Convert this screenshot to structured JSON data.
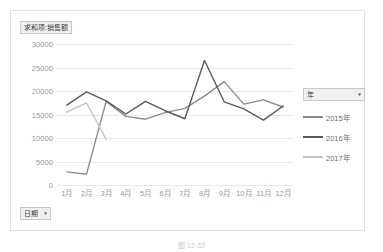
{
  "value_field": {
    "label": "求和项:销售额",
    "arrow": "▾"
  },
  "date_field": {
    "label": "日期",
    "arrow": "▾"
  },
  "legend_field": {
    "label": "年",
    "arrow": "▾"
  },
  "caption": "图 12-32",
  "colors": {
    "series_2015": "#8c8c8c",
    "series_2016": "#5a5a5a",
    "series_2017": "#c4c4c4",
    "gridline": "#e8e8e8",
    "axis_text": "#9a9a9a",
    "frame_border": "#e2e2e2",
    "field_button_bg": "#f0f0f0"
  },
  "chart_data": {
    "type": "line",
    "title": "求和项:销售额",
    "xlabel": "日期",
    "ylabel": "",
    "categories": [
      "1月",
      "2月",
      "3月",
      "4月",
      "5月",
      "6月",
      "7月",
      "8月",
      "9月",
      "10月",
      "11月",
      "12月"
    ],
    "ylim": [
      0,
      30000
    ],
    "yticks": [
      0,
      5000,
      10000,
      15000,
      20000,
      25000,
      30000
    ],
    "ytick_labels": [
      "0",
      "5000",
      "10000",
      "15000",
      "20000",
      "25000",
      "30000"
    ],
    "grid": true,
    "legend_position": "right",
    "series": [
      {
        "name": "2015年",
        "color": "#8c8c8c",
        "values": [
          2800,
          2300,
          17800,
          14600,
          14000,
          15400,
          16300,
          18900,
          22000,
          17200,
          18100,
          16600
        ]
      },
      {
        "name": "2016年",
        "color": "#5a5a5a",
        "values": [
          17000,
          19800,
          17900,
          15100,
          17800,
          15800,
          14100,
          26500,
          17700,
          16200,
          13800,
          16800
        ]
      },
      {
        "name": "2017年",
        "color": "#c4c4c4",
        "values": [
          15500,
          17500,
          9700,
          null,
          null,
          null,
          null,
          null,
          null,
          null,
          null,
          null
        ]
      }
    ]
  }
}
